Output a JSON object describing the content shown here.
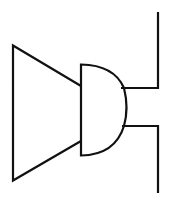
{
  "diagram": {
    "symbol": "buzzer-speaker",
    "stroke_color": "#111111",
    "background": "#ffffff",
    "stroke_width": 2.2
  }
}
